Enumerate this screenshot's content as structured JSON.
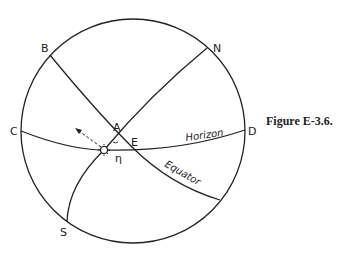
{
  "figure": {
    "caption": "Figure E-3.6.",
    "points": {
      "B": "B",
      "N": "N",
      "C": "C",
      "D": "D",
      "A": "A",
      "E": "E",
      "S": "S",
      "eta": "η"
    },
    "curves": {
      "horizon": "Horizon",
      "equator": "Equator"
    },
    "colors": {
      "stroke": "#222222",
      "background": "#ffffff"
    }
  }
}
